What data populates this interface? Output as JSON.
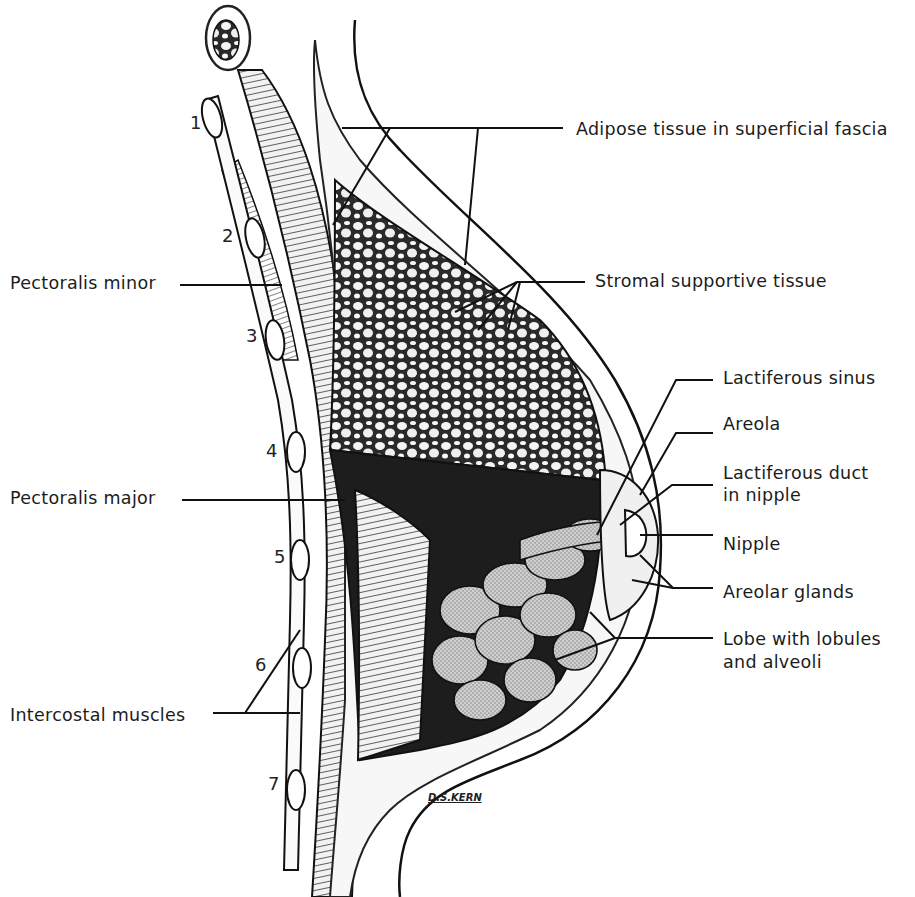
{
  "figure": {
    "artist_signature": "D.S.KERN",
    "labels": {
      "adipose": "Adipose tissue in superficial fascia",
      "stromal": "Stromal supportive tissue",
      "lactiferous_sinus": "Lactiferous sinus",
      "areola": "Areola",
      "lactiferous_duct_line1": "Lactiferous duct",
      "lactiferous_duct_line2": "in nipple",
      "nipple": "Nipple",
      "areolar_glands": "Areolar glands",
      "lobe_line1": "Lobe with lobules",
      "lobe_line2": "and alveoli",
      "pectoralis_minor": "Pectoralis minor",
      "pectoralis_major": "Pectoralis major",
      "intercostal": "Intercostal muscles"
    },
    "rib_numbers": [
      "1",
      "2",
      "3",
      "4",
      "5",
      "6",
      "7"
    ]
  }
}
